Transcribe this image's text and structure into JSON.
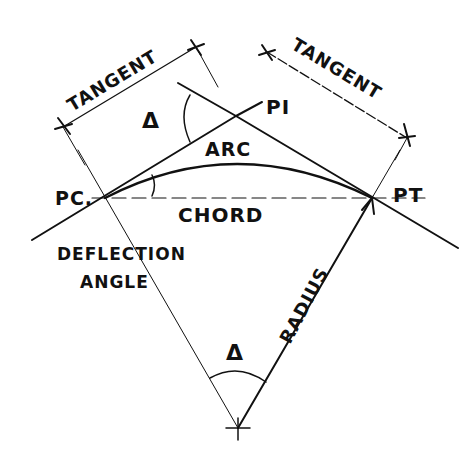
{
  "diagram": {
    "labels": {
      "tangent_left": "TANGENT",
      "tangent_right": "TANGENT",
      "delta_top": "Δ",
      "pi": "PI",
      "arc": "ARC",
      "pc": "PC.",
      "chord": "CHORD",
      "pt": "PT",
      "deflection_line1": "DEFLECTION",
      "deflection_line2": "ANGLE",
      "radius": "RADIUS",
      "delta_bottom": "Δ"
    },
    "colors": {
      "ink": "#111111",
      "background": "#ffffff"
    }
  }
}
